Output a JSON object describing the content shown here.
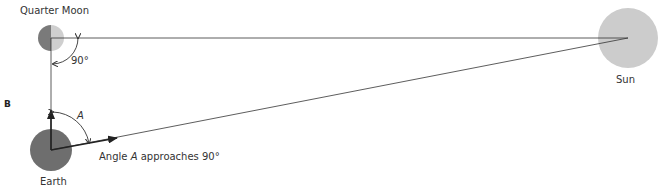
{
  "diagram": {
    "panel_label": "B",
    "labels": {
      "moon": "Quarter Moon",
      "sun": "Sun",
      "earth": "Earth",
      "moon_angle": "90°",
      "earth_angle": "A",
      "caption_prefix": "Angle ",
      "caption_var": "A",
      "caption_suffix": " approaches 90°"
    },
    "colors": {
      "sun": "#cccccc",
      "earth": "#6e6e6e",
      "moon_dark": "#7a7a7a",
      "moon_light": "#cfcfcf",
      "line": "#333333"
    }
  }
}
